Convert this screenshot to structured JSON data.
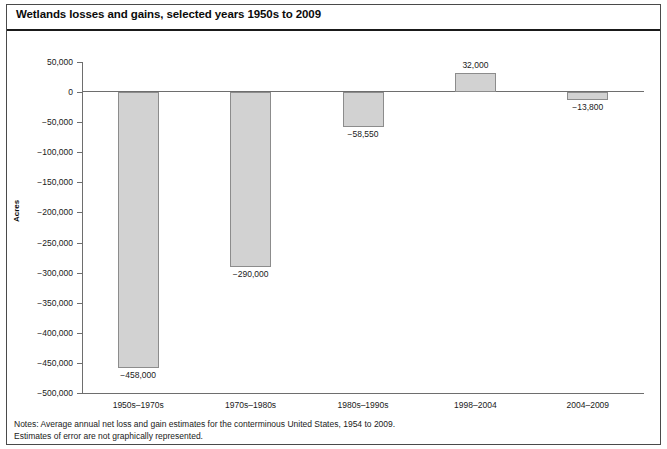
{
  "figure": {
    "title": "Wetlands losses and gains, selected years 1950s to 2009",
    "notes_line1": "Notes: Average annual net loss and gain estimates for the conterminous United States, 1954 to 2009.",
    "notes_line2": "Estimates of error are not graphically represented."
  },
  "colors": {
    "bar_fill": "#d2d2d2",
    "bar_border": "#8c8c8c",
    "axis": "#6e6e6e",
    "text": "#1a1a1a",
    "frame": "#4a4a4a"
  },
  "chart_data": {
    "type": "bar",
    "title": "Wetlands losses and gains, selected years 1950s to 2009",
    "xlabel": "",
    "ylabel": "Acres",
    "categories": [
      "1950s–1970s",
      "1970s–1980s",
      "1980s–1990s",
      "1998–2004",
      "2004–2009"
    ],
    "values": [
      -458000,
      -290000,
      -58550,
      32000,
      -13800
    ],
    "value_labels": [
      "−458,000",
      "−290,000",
      "−58,550",
      "32,000",
      "−13,800"
    ],
    "ylim": [
      -500000,
      50000
    ],
    "ytick_values": [
      50000,
      0,
      -50000,
      -100000,
      -150000,
      -200000,
      -250000,
      -300000,
      -350000,
      -400000,
      -450000,
      -500000
    ],
    "ytick_labels": [
      "50,000",
      "0",
      "−50,000",
      "−100,000",
      "−150,000",
      "−200,000",
      "−250,000",
      "−300,000",
      "−350,000",
      "−400,000",
      "−450,000",
      "−500,000"
    ],
    "grid": false,
    "legend": null,
    "zero_line": true,
    "series": [
      {
        "name": "Average annual net wetland change (acres)",
        "values": [
          -458000,
          -290000,
          -58550,
          32000,
          -13800
        ]
      }
    ]
  }
}
